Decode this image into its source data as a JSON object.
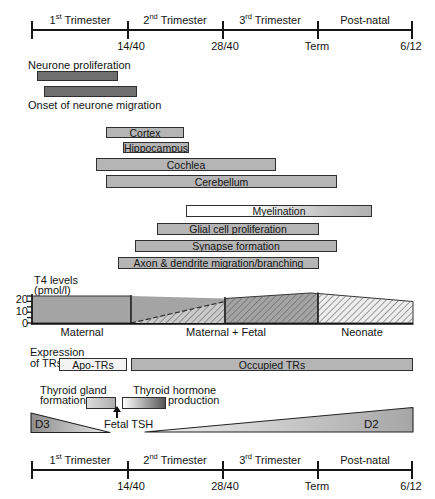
{
  "timeline": {
    "segments": [
      {
        "ord": "1",
        "sup": "st",
        "name": "Trimester"
      },
      {
        "ord": "2",
        "sup": "nd",
        "name": "Trimester"
      },
      {
        "ord": "3",
        "sup": "rd",
        "name": "Trimester"
      },
      {
        "ord": "",
        "sup": "",
        "name": "Post-natal"
      }
    ],
    "milestones": [
      "14/40",
      "28/40",
      "Term",
      "6/12"
    ]
  },
  "dark_bars": [
    {
      "label": "Neurone proliferation",
      "x": 37,
      "y": 71,
      "w": 81,
      "h": 10,
      "label_side": "above"
    },
    {
      "label": "Onset of neurone migration",
      "x": 44,
      "y": 86,
      "w": 93,
      "h": 11,
      "label_side": "below"
    }
  ],
  "structure_bars": [
    {
      "label": "Cortex",
      "x": 106,
      "y": 127,
      "w": 78,
      "h": 11
    },
    {
      "label": "Hippocampus",
      "x": 123,
      "y": 142,
      "w": 66,
      "h": 11
    },
    {
      "label": "Cochlea",
      "x": 96,
      "y": 158,
      "w": 180,
      "h": 13
    },
    {
      "label": "Cerebellum",
      "x": 106,
      "y": 175,
      "w": 231,
      "h": 13
    }
  ],
  "process_bars": [
    {
      "label": "Myelination",
      "x": 186,
      "y": 205,
      "w": 186,
      "h": 12,
      "fade": true
    },
    {
      "label": "Glial cell proliferation",
      "x": 157,
      "y": 223,
      "w": 162,
      "h": 12
    },
    {
      "label": "Synapse formation",
      "x": 135,
      "y": 240,
      "w": 202,
      "h": 12
    },
    {
      "label": "Axon & dendrite migration/branching",
      "x": 118,
      "y": 257,
      "w": 201,
      "h": 12
    }
  ],
  "t4_chart": {
    "type": "area",
    "title": "T4 levels",
    "units": "(pmol/l)",
    "yticks": [
      "20",
      "10",
      "0"
    ],
    "ylim": [
      0,
      20
    ],
    "sections": [
      "Maternal",
      "Maternal + Fetal",
      "Neonate"
    ],
    "series": [
      {
        "name": "Maternal T4",
        "style": "solid-gray",
        "values": "~18-20 pmol/l through 14/40, then gradually declining toward term"
      },
      {
        "name": "Fetal/Neonatal T4",
        "style": "hatched",
        "values": "0 at 14/40 rising to ~20 pmol/l at term, ~15 pmol/l by 6/12"
      }
    ]
  },
  "tr_expression": {
    "label_line1": "Expression",
    "label_line2": "of TRs",
    "segments": [
      {
        "label": "Apo-TRs"
      },
      {
        "label": "Occupied TRs"
      }
    ]
  },
  "thyroid": {
    "gland_line1": "Thyroid gland",
    "gland_line2": "formation",
    "hormone_line1": "Thyroid hormone",
    "hormone_line2": "production",
    "tsh_label": "Fetal TSH",
    "d3_label": "D3",
    "d2_label": "D2"
  },
  "colors": {
    "dark_bar": "#6f6f6f",
    "light_bar": "#b5b5b5",
    "bar_border": "#2e2e2e",
    "gray_area": "#a4a4a4",
    "neonate_area": "#ededed",
    "hatch_line": "#5d5d5d"
  }
}
